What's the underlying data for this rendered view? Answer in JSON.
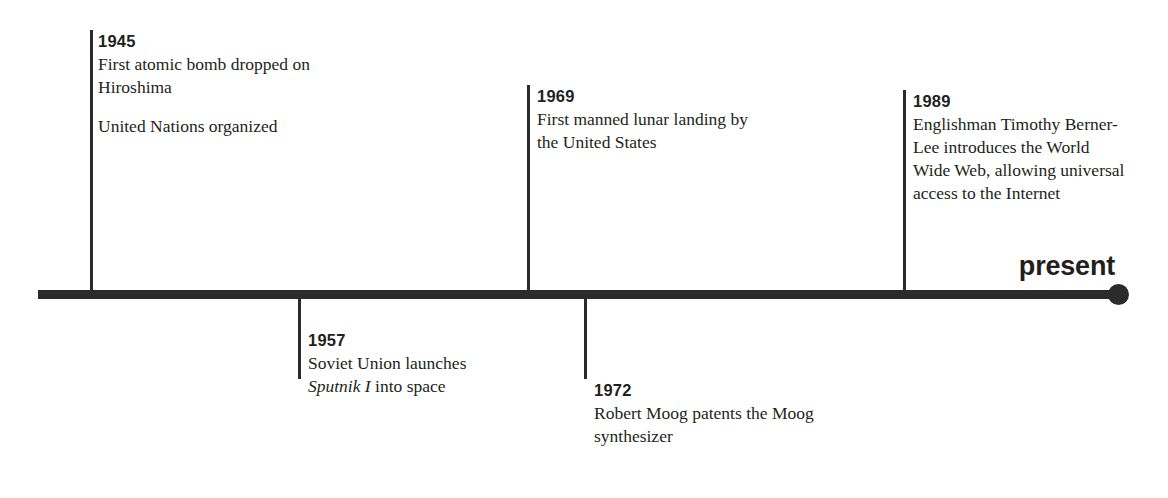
{
  "document": {
    "type": "historical-timeline",
    "present_label": "present"
  },
  "timeline": {
    "events_above": [
      {
        "year": "1945",
        "lines": [
          "First atomic bomb dropped on Hiroshima",
          "United Nations organized"
        ],
        "line1": "First atomic bomb dropped on Hiroshima",
        "line2": "United Nations organized"
      },
      {
        "year": "1969",
        "line1": "First manned lunar landing by the United States"
      },
      {
        "year": "1989",
        "line1": "Englishman Timothy Berner-Lee introduces the World Wide Web, allowing universal access to the Internet"
      }
    ],
    "events_below": [
      {
        "year": "1957",
        "part1": "Soviet Union launches ",
        "italic": "Sputnik I",
        "part2": " into space"
      },
      {
        "year": "1972",
        "line1": "Robert Moog patents the Moog synthesizer"
      }
    ]
  },
  "colors": {
    "ink": "#231f20",
    "rule": "#2b2b2b",
    "background": "#ffffff"
  }
}
